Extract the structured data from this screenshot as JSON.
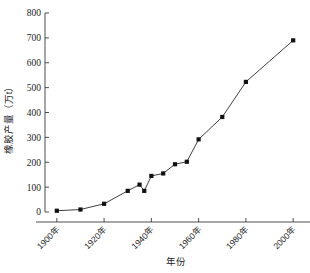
{
  "chart_data": {
    "type": "line",
    "title": "",
    "xlabel": "年份",
    "ylabel": "橡胶产量（万t）",
    "xlim": [
      1895,
      2005
    ],
    "ylim": [
      0,
      800
    ],
    "grid": false,
    "legend": null,
    "x_tick_labels": [
      "1900年",
      "1920年",
      "1940年",
      "1960年",
      "1980年",
      "2000年"
    ],
    "x_tick_values": [
      1900,
      1920,
      1940,
      1960,
      1980,
      2000
    ],
    "y_tick_labels": [
      "0",
      "100",
      "200",
      "300",
      "400",
      "500",
      "600",
      "700",
      "800"
    ],
    "y_tick_values": [
      0,
      100,
      200,
      300,
      400,
      500,
      600,
      700,
      800
    ],
    "marker_style": "filled-square",
    "line_color": "#2a2a2a",
    "marker_color": "#111111",
    "x": [
      1900,
      1910,
      1920,
      1930,
      1935,
      1937,
      1940,
      1945,
      1950,
      1955,
      1960,
      1970,
      1980,
      2000
    ],
    "values": [
      5,
      10,
      33,
      85,
      110,
      85,
      145,
      155,
      192,
      202,
      292,
      382,
      523,
      690
    ],
    "series": [
      {
        "name": "橡胶产量",
        "points": [
          {
            "x": 1900,
            "y": 5
          },
          {
            "x": 1910,
            "y": 10
          },
          {
            "x": 1920,
            "y": 33
          },
          {
            "x": 1930,
            "y": 85
          },
          {
            "x": 1935,
            "y": 110
          },
          {
            "x": 1937,
            "y": 85
          },
          {
            "x": 1940,
            "y": 145
          },
          {
            "x": 1945,
            "y": 155
          },
          {
            "x": 1950,
            "y": 192
          },
          {
            "x": 1955,
            "y": 202
          },
          {
            "x": 1960,
            "y": 292
          },
          {
            "x": 1970,
            "y": 382
          },
          {
            "x": 1980,
            "y": 523
          },
          {
            "x": 2000,
            "y": 690
          }
        ]
      }
    ]
  }
}
